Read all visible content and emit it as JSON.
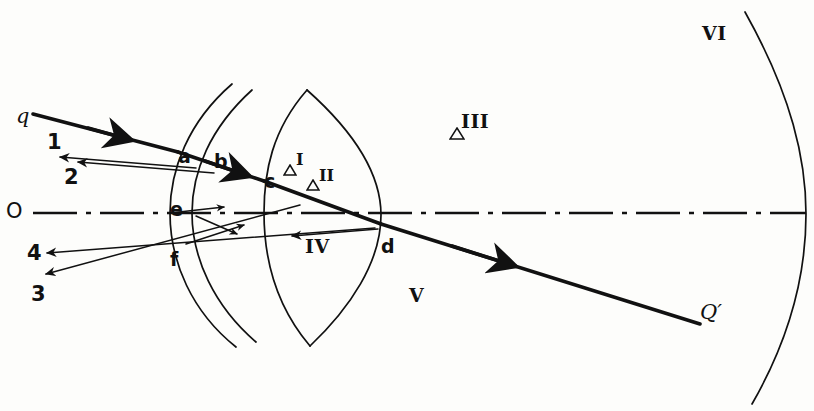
{
  "figure": {
    "kind": "optical-ray-diagram",
    "background_color": "#fdfdfb",
    "ink_color": "#111111",
    "width": 814,
    "height": 411
  },
  "axis": {
    "name": "optical-axis",
    "origin_label": "O",
    "style": "dash-dot",
    "y": 213,
    "x_start": 33,
    "x_end": 806
  },
  "incident_ray": {
    "label": "q",
    "label_x": 16,
    "label_y": 106,
    "start_x": 33,
    "start_y": 114,
    "end_x": 700,
    "end_y": 324,
    "weight": "heavy"
  },
  "exit_label": {
    "text": "Q′",
    "x": 700,
    "y": 302
  },
  "surface_points": [
    {
      "label": "a",
      "x": 178,
      "y": 147,
      "surface": "anterior-cornea"
    },
    {
      "label": "b",
      "x": 214,
      "y": 152,
      "surface": "posterior-cornea"
    },
    {
      "label": "c",
      "x": 264,
      "y": 172,
      "surface": "anterior-lens"
    },
    {
      "label": "d",
      "x": 381,
      "y": 237,
      "surface": "posterior-lens"
    },
    {
      "label": "e",
      "x": 170,
      "y": 200,
      "surface": "anterior-cornea"
    },
    {
      "label": "f",
      "x": 170,
      "y": 250,
      "surface": "posterior-cornea"
    }
  ],
  "reflected_rays": [
    {
      "label": "1",
      "label_x": 47,
      "label_y": 132,
      "tip_x": 60,
      "tip_y": 157
    },
    {
      "label": "2",
      "label_x": 64,
      "label_y": 167,
      "tip_x": 78,
      "tip_y": 162
    },
    {
      "label": "4",
      "label_x": 27,
      "label_y": 243,
      "tip_x": 47,
      "tip_y": 253
    },
    {
      "label": "3",
      "label_x": 31,
      "label_y": 284,
      "tip_x": 46,
      "tip_y": 274
    }
  ],
  "region_labels": [
    {
      "text": "I",
      "x": 296,
      "y": 152,
      "triangle": true,
      "size": "small"
    },
    {
      "text": "II",
      "x": 319,
      "y": 168,
      "triangle": true,
      "size": "small"
    },
    {
      "text": "III",
      "x": 461,
      "y": 112,
      "triangle": true,
      "size": "normal"
    },
    {
      "text": "IV",
      "x": 305,
      "y": 237,
      "triangle": false,
      "size": "normal"
    },
    {
      "text": "V",
      "x": 409,
      "y": 286,
      "triangle": false,
      "size": "normal"
    },
    {
      "text": "VI",
      "x": 702,
      "y": 24,
      "triangle": false,
      "size": "normal"
    }
  ],
  "structures": {
    "cornea_front": "arc",
    "cornea_back": "arc",
    "lens_front": "arc",
    "lens_back": "arc",
    "retina": "arc"
  }
}
